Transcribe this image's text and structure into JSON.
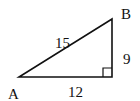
{
  "diagram": {
    "type": "right-triangle",
    "vertices": {
      "A": {
        "label": "A"
      },
      "B": {
        "label": "B"
      },
      "C": {
        "label": ""
      }
    },
    "sides": {
      "hypotenuse": {
        "label": "15"
      },
      "vertical": {
        "label": "9"
      },
      "base": {
        "label": "12"
      }
    },
    "right_angle_at": "bottom-right",
    "stroke_color": "#111111"
  }
}
